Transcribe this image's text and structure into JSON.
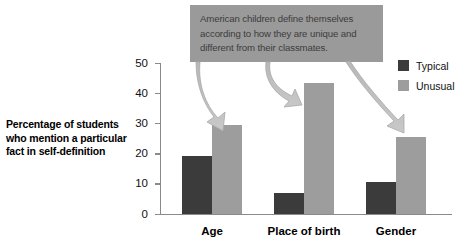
{
  "chart_data": {
    "type": "bar",
    "title": "",
    "xlabel": "",
    "ylabel": "Percentage of students who mention a particular fact in self-definition",
    "ylim": [
      0,
      50
    ],
    "yticks": [
      0,
      10,
      20,
      30,
      40,
      50
    ],
    "ytick_labels": [
      "0",
      "10",
      "20",
      "30",
      "40",
      "50"
    ],
    "grid": false,
    "legend_position": "right",
    "categories": [
      "Age",
      "Place of birth",
      "Gender"
    ],
    "series": [
      {
        "name": "Typical",
        "color": "#3b3b3b",
        "values": [
          19,
          6.7,
          10.5
        ]
      },
      {
        "name": "Unusual",
        "color": "#9d9d9d",
        "values": [
          29.5,
          43.5,
          25.5
        ]
      }
    ],
    "annotations": [
      {
        "text": "American children define themselves according to how they are unique and different from their classmates.",
        "points_to": [
          "Age / Unusual",
          "Place of birth / Unusual",
          "Gender / Unusual"
        ]
      }
    ]
  },
  "y_axis_title_lines": [
    "Percentage of students",
    "who mention a particular",
    "fact in self-definition"
  ],
  "callout": {
    "text": "American children define themselves according to how they are unique and different from their classmates.",
    "background_color": "#9a9a9a",
    "text_color": "#3c3c3c"
  },
  "legend": {
    "items": [
      {
        "label": "Typical",
        "color": "#3b3b3b"
      },
      {
        "label": "Unusual",
        "color": "#9d9d9d"
      }
    ]
  },
  "axis": {
    "tick_labels": [
      "50",
      "40",
      "30",
      "20",
      "10",
      "0"
    ]
  },
  "categories": [
    "Age",
    "Place of birth",
    "Gender"
  ]
}
